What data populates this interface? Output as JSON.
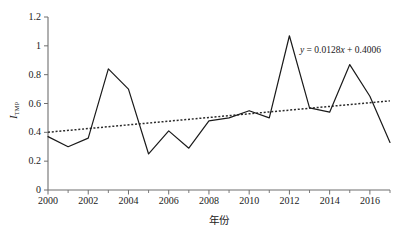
{
  "chart_data": {
    "type": "line",
    "title": "",
    "xlabel": "年份",
    "ylabel": "I_TMP",
    "ylabel_main": "I",
    "ylabel_sub": "TMP",
    "xlim": [
      2000,
      2017
    ],
    "ylim": [
      0,
      1.2
    ],
    "grid": false,
    "legend": null,
    "x": [
      2000,
      2001,
      2002,
      2003,
      2004,
      2005,
      2006,
      2007,
      2008,
      2009,
      2010,
      2011,
      2012,
      2013,
      2014,
      2015,
      2016,
      2017
    ],
    "series": [
      {
        "name": "I_TMP",
        "style": "solid",
        "color": "#1a1a1a",
        "values": [
          0.37,
          0.3,
          0.36,
          0.84,
          0.7,
          0.25,
          0.41,
          0.29,
          0.48,
          0.5,
          0.55,
          0.5,
          1.07,
          0.57,
          0.54,
          0.87,
          0.65,
          0.33
        ]
      },
      {
        "name": "trend",
        "style": "dotted",
        "color": "#2b2b2b",
        "equation": "y = 0.0128x + 0.4006",
        "slope": 0.0128,
        "intercept": 0.4006,
        "values": [
          0.4006,
          0.4134,
          0.4262,
          0.439,
          0.4518,
          0.4646,
          0.4774,
          0.4902,
          0.503,
          0.5158,
          0.5286,
          0.5414,
          0.5542,
          0.567,
          0.5798,
          0.5926,
          0.6054,
          0.6182
        ]
      }
    ],
    "x_ticks": [
      2000,
      2002,
      2004,
      2006,
      2008,
      2010,
      2012,
      2014,
      2016
    ],
    "x_tick_labels": [
      "2000",
      "2002",
      "2004",
      "2006",
      "2008",
      "2010",
      "2012",
      "2014",
      "2016"
    ],
    "x_minor_ticks": [
      2001,
      2003,
      2005,
      2007,
      2009,
      2011,
      2013,
      2015,
      2017
    ],
    "y_ticks": [
      0,
      0.2,
      0.4,
      0.6,
      0.8,
      1,
      1.2
    ],
    "y_tick_labels": [
      "0",
      "0.2",
      "0.4",
      "0.6",
      "0.8",
      "1",
      "1.2"
    ],
    "annotations": [
      {
        "name": "trend-equation",
        "text": "y = 0.0128x + 0.4006",
        "x_px": 300,
        "y_px": 45
      }
    ],
    "axis_color": "#6f6f6f"
  }
}
